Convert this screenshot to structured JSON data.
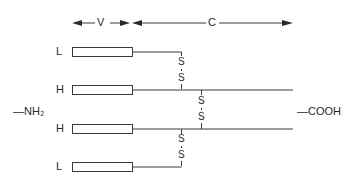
{
  "diagram": {
    "type": "antibody-structure",
    "regions": {
      "variable": "V",
      "constant": "C"
    },
    "chains": [
      {
        "label": "L",
        "type": "light"
      },
      {
        "label": "H",
        "type": "heavy"
      },
      {
        "label": "H",
        "type": "heavy"
      },
      {
        "label": "L",
        "type": "light"
      }
    ],
    "terminals": {
      "amino": "—NH₂",
      "carboxyl": "—COOH"
    },
    "disulfide_bond": {
      "top": "S",
      "bottom": "S"
    },
    "colors": {
      "stroke": "#3a3a3a",
      "text": "#2a2a2a",
      "background": "#ffffff"
    }
  }
}
